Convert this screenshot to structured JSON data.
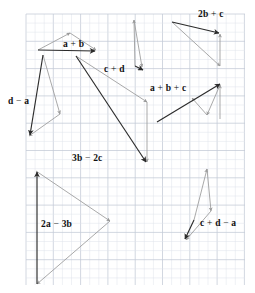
{
  "figure": {
    "type": "vector-addition-diagram",
    "canvas": {
      "width": 255,
      "height": 293
    },
    "grid": {
      "x0": 26,
      "y0": 14,
      "x1": 245,
      "y1": 285,
      "cell": 9.1,
      "minor_color": "#dfe3ea",
      "major_color": "#c3cad6",
      "major_every": 3,
      "visible": true
    },
    "colors": {
      "resultant": "#2b2b2b",
      "component": "#9a9a9a",
      "label_text": "#111111",
      "background": "#ffffff"
    },
    "labels": [
      {
        "id": "label-a-plus-b",
        "text": "a + b",
        "x": 63,
        "y": 47,
        "anchor": "start"
      },
      {
        "id": "label-c-plus-d",
        "text": "c + d",
        "x": 104,
        "y": 72,
        "anchor": "start"
      },
      {
        "id": "label-2b-plus-c",
        "text": "2b + c",
        "x": 198,
        "y": 17,
        "anchor": "start"
      },
      {
        "id": "label-a-plus-b-plus-c",
        "text": "a + b + c",
        "x": 150,
        "y": 91,
        "anchor": "start"
      },
      {
        "id": "label-d-minus-a",
        "text": "d − a",
        "x": 8,
        "y": 104,
        "anchor": "start"
      },
      {
        "id": "label-3b-minus-2c",
        "text": "3b − 2c",
        "x": 72,
        "y": 161,
        "anchor": "start"
      },
      {
        "id": "label-2a-minus-3b",
        "text": "2a − 3b",
        "x": 41,
        "y": 227,
        "anchor": "start"
      },
      {
        "id": "label-c-plus-d-minus-a",
        "text": "c + d − a",
        "x": 200,
        "y": 226,
        "anchor": "start"
      }
    ],
    "groups": [
      {
        "id": "group-a-plus-b",
        "label": "a + b",
        "vectors": [
          {
            "id": "vec-a",
            "role": "component",
            "x1": 38,
            "y1": 50,
            "x2": 70,
            "y2": 33
          },
          {
            "id": "vec-b",
            "role": "component",
            "x1": 70,
            "y1": 33,
            "x2": 96,
            "y2": 50
          },
          {
            "id": "vec-a-plus-b",
            "role": "resultant",
            "x1": 38,
            "y1": 50,
            "x2": 95,
            "y2": 51
          }
        ]
      },
      {
        "id": "group-c-plus-d",
        "label": "c + d",
        "vectors": [
          {
            "id": "vec-c",
            "role": "component",
            "x1": 135,
            "y1": 66,
            "x2": 134,
            "y2": 20
          },
          {
            "id": "vec-d",
            "role": "component",
            "x1": 134,
            "y1": 20,
            "x2": 142,
            "y2": 67
          },
          {
            "id": "vec-c-plus-d",
            "role": "resultant",
            "x1": 135,
            "y1": 66,
            "x2": 143,
            "y2": 70
          }
        ]
      },
      {
        "id": "group-2b-plus-c",
        "label": "2b + c",
        "vectors": [
          {
            "id": "vec-2b",
            "role": "component",
            "x1": 172,
            "y1": 22,
            "x2": 220,
            "y2": 66
          },
          {
            "id": "vec-c2",
            "role": "component",
            "x1": 220,
            "y1": 66,
            "x2": 220,
            "y2": 34
          },
          {
            "id": "vec-2b-plus-c",
            "role": "resultant",
            "x1": 172,
            "y1": 22,
            "x2": 219,
            "y2": 33
          }
        ]
      },
      {
        "id": "group-a-plus-b-plus-c",
        "label": "a + b + c",
        "vectors": [
          {
            "id": "vec-abc-1",
            "role": "component",
            "x1": 220,
            "y1": 119,
            "x2": 220,
            "y2": 85
          },
          {
            "id": "vec-abc-2",
            "role": "component",
            "x1": 220,
            "y1": 85,
            "x2": 207,
            "y2": 115
          },
          {
            "id": "vec-abc-3",
            "role": "component",
            "x1": 207,
            "y1": 115,
            "x2": 192,
            "y2": 98
          },
          {
            "id": "vec-a-plus-b-plus-c",
            "role": "resultant",
            "x1": 157,
            "y1": 122,
            "x2": 220,
            "y2": 84
          }
        ]
      },
      {
        "id": "group-d-minus-a",
        "label": "d − a",
        "vectors": [
          {
            "id": "vec-d2",
            "role": "component",
            "x1": 43,
            "y1": 55,
            "x2": 60,
            "y2": 114
          },
          {
            "id": "vec-minus-a",
            "role": "component",
            "x1": 60,
            "y1": 114,
            "x2": 29,
            "y2": 136
          },
          {
            "id": "vec-d-minus-a",
            "role": "resultant",
            "x1": 43,
            "y1": 55,
            "x2": 30,
            "y2": 135
          }
        ]
      },
      {
        "id": "group-3b-minus-2c",
        "label": "3b − 2c",
        "vectors": [
          {
            "id": "vec-3b",
            "role": "component",
            "x1": 76,
            "y1": 56,
            "x2": 147,
            "y2": 102
          },
          {
            "id": "vec-minus-2c",
            "role": "component",
            "x1": 147,
            "y1": 102,
            "x2": 147,
            "y2": 162
          },
          {
            "id": "vec-3b-minus-2c",
            "role": "resultant",
            "x1": 76,
            "y1": 56,
            "x2": 146,
            "y2": 162
          }
        ]
      },
      {
        "id": "group-2a-minus-3b",
        "label": "2a − 3b",
        "vectors": [
          {
            "id": "vec-2a",
            "role": "component",
            "x1": 36,
            "y1": 171,
            "x2": 110,
            "y2": 221
          },
          {
            "id": "vec-minus-3b",
            "role": "component",
            "x1": 110,
            "y1": 221,
            "x2": 37,
            "y2": 284
          },
          {
            "id": "vec-2a-minus-3b",
            "role": "resultant",
            "x1": 37,
            "y1": 284,
            "x2": 37,
            "y2": 172
          }
        ]
      },
      {
        "id": "group-c-plus-d-minus-a",
        "label": "c + d − a",
        "vectors": [
          {
            "id": "vec-cda-1",
            "role": "component",
            "x1": 194,
            "y1": 220,
            "x2": 207,
            "y2": 169
          },
          {
            "id": "vec-cda-2",
            "role": "component",
            "x1": 207,
            "y1": 169,
            "x2": 211,
            "y2": 211
          },
          {
            "id": "vec-cda-3",
            "role": "component",
            "x1": 211,
            "y1": 211,
            "x2": 186,
            "y2": 240
          },
          {
            "id": "vec-c-plus-d-minus-a",
            "role": "resultant",
            "x1": 194,
            "y1": 220,
            "x2": 185,
            "y2": 239
          }
        ]
      }
    ]
  }
}
